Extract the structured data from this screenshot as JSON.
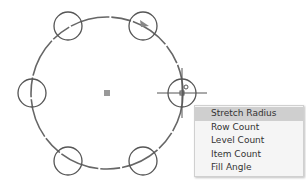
{
  "drawing": {
    "main_circle": {
      "cx": 107,
      "cy": 93,
      "r": 76
    },
    "center_marker": {
      "x": 107,
      "y": 93
    },
    "array_items": [
      {
        "cx": 68,
        "cy": 26,
        "r": 14
      },
      {
        "cx": 143,
        "cy": 26,
        "r": 14
      },
      {
        "cx": 32,
        "cy": 93,
        "r": 14
      },
      {
        "cx": 182,
        "cy": 93,
        "r": 14
      },
      {
        "cx": 68,
        "cy": 161,
        "r": 14
      },
      {
        "cx": 143,
        "cy": 161,
        "r": 14
      }
    ],
    "cursor": {
      "x": 182,
      "y": 93
    }
  },
  "context_menu": {
    "items": [
      {
        "label": "Stretch Radius",
        "highlighted": true
      },
      {
        "label": "Row Count"
      },
      {
        "label": "Level Count"
      },
      {
        "label": "Item Count"
      },
      {
        "label": "Fill Angle"
      }
    ]
  }
}
